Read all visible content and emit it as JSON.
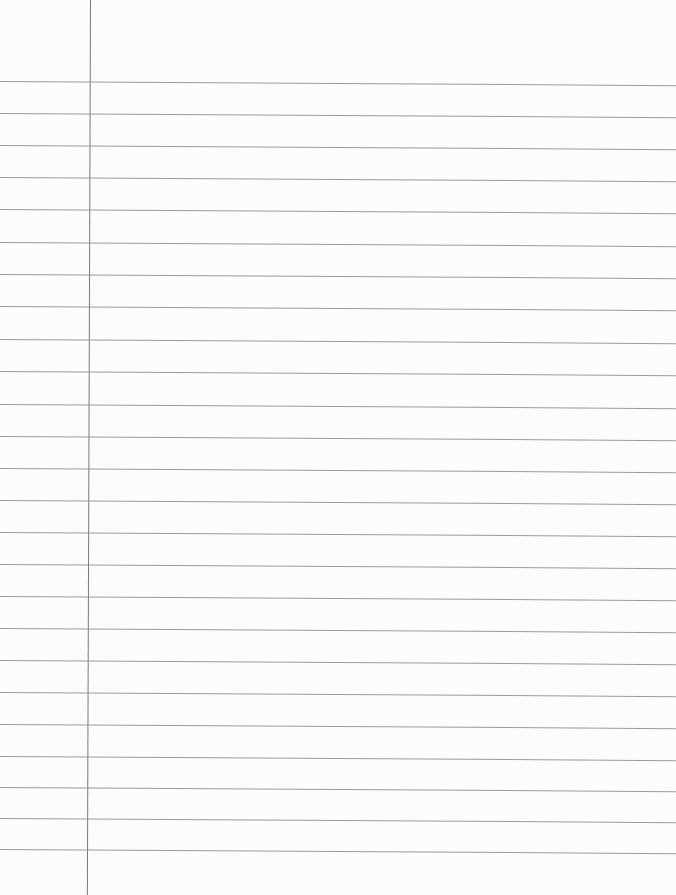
{
  "paper": {
    "type": "lined-notebook-paper",
    "background": "#fcfcfc",
    "rule_color": "#8a8a8a",
    "margin_color": "#7a7a7a",
    "margin_x": 90,
    "rule_y": [
      81,
      113,
      145,
      177,
      209,
      242,
      274,
      306,
      339,
      371,
      404,
      436,
      468,
      500,
      532,
      564,
      596,
      628,
      660,
      692,
      724,
      756,
      787,
      818,
      849
    ]
  }
}
